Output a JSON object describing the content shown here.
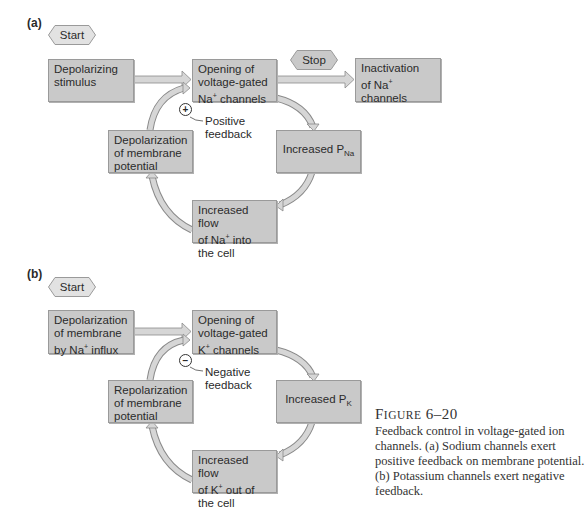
{
  "panel_a": {
    "label": "(a)",
    "start": "Start",
    "stop": "Stop",
    "depolarizing_stimulus": "Depolarizing stimulus",
    "opening": {
      "line1": "Opening of",
      "line2": "voltage-gated",
      "line3_pre": "Na",
      "line3_sup": "+",
      "line3_post": " channels"
    },
    "inactivation": {
      "line1": "Inactivation",
      "line2_pre": "of Na",
      "line2_sup": "+",
      "line2_post": " channels"
    },
    "depolarization": {
      "line1": "Depolarization",
      "line2": "of membrane",
      "line3": "potential"
    },
    "increased_p": {
      "main": "Increased P",
      "sub": "Na"
    },
    "increased_flow": {
      "line1": "Increased flow",
      "line2_pre": "of Na",
      "line2_sup": "+",
      "line2_post": " into",
      "line3": "the cell"
    },
    "feedback_symbol": "+",
    "feedback_label": {
      "line1": "Positive",
      "line2": "feedback"
    }
  },
  "panel_b": {
    "label": "(b)",
    "start": "Start",
    "depolarization_influx": {
      "line1": "Depolarization",
      "line2": "of membrane",
      "line3_pre": "by Na",
      "line3_sup": "+",
      "line3_post": " influx"
    },
    "opening": {
      "line1": "Opening of",
      "line2": "voltage-gated",
      "line3_pre": "K",
      "line3_sup": "+",
      "line3_post": " channels"
    },
    "repolarization": {
      "line1": "Repolarization",
      "line2": "of membrane",
      "line3": "potential"
    },
    "increased_p": {
      "main": "Increased P",
      "sub": "K"
    },
    "increased_flow": {
      "line1": "Increased flow",
      "line2_pre": "of K",
      "line2_sup": "+",
      "line2_post": " out of",
      "line3": "the cell"
    },
    "feedback_symbol": "−",
    "feedback_label": {
      "line1": "Negative",
      "line2": "feedback"
    }
  },
  "caption": {
    "title_first": "F",
    "title_rest": "IGURE",
    "title_number": "6–20",
    "body": "Feedback control in voltage-gated ion channels. (a) Sodium channels exert positive feedback on membrane potential. (b) Potassium channels exert negative feedback."
  },
  "colors": {
    "box_fill": "#c9c9c9",
    "box_border": "#9a9a9a",
    "arrow_fill": "#d6d6d6",
    "arrow_stroke": "#8a8a8a",
    "hex_fill": "#e2e2e2"
  }
}
